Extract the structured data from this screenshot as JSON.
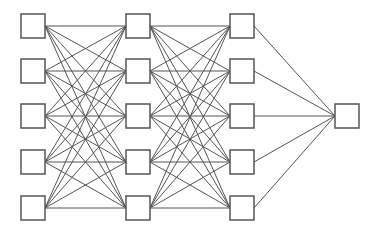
{
  "diagram": {
    "type": "neural-network",
    "colors": {
      "stroke": "#555555",
      "box_fill": "#ffffff",
      "background": "#ffffff"
    },
    "box_size": 24,
    "layers": [
      {
        "name": "input",
        "x": 21,
        "nodes_y": [
          14,
          59,
          104,
          150,
          196
        ]
      },
      {
        "name": "hidden1",
        "x": 126,
        "nodes_y": [
          14,
          59,
          104,
          150,
          196
        ]
      },
      {
        "name": "hidden2",
        "x": 230,
        "nodes_y": [
          14,
          59,
          104,
          150,
          196
        ]
      },
      {
        "name": "output",
        "x": 335,
        "nodes_y": [
          104
        ]
      }
    ],
    "connectivity": "fully-connected"
  }
}
